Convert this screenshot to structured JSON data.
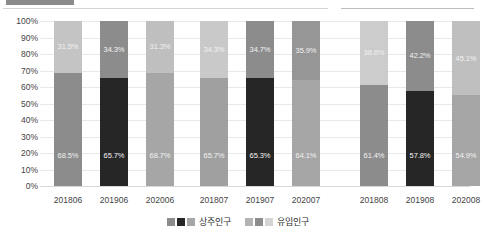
{
  "chart_data": {
    "type": "bar",
    "subtype": "stacked-100-percent",
    "title": "",
    "xlabel": "",
    "ylabel": "",
    "ylim": [
      0,
      100
    ],
    "ytick_labels": [
      "100%",
      "90%",
      "80%",
      "70%",
      "60%",
      "50%",
      "40%",
      "30%",
      "20%",
      "10%",
      "0%"
    ],
    "ytick_values": [
      100,
      90,
      80,
      70,
      60,
      50,
      40,
      30,
      20,
      10,
      0
    ],
    "grid": true,
    "legend_position": "bottom",
    "categories": [
      "201806",
      "201906",
      "202006",
      "201807",
      "201907",
      "202007",
      "201808",
      "201908",
      "202008"
    ],
    "groups": [
      {
        "name": "6월",
        "categories": [
          "201806",
          "201906",
          "202006"
        ],
        "bars": [
          {
            "category": "201806",
            "bottom_value": 68.5,
            "bottom_label": "68.5%",
            "top_value": 31.5,
            "top_label": "31.5%",
            "bottom_color": "#8c8c8c",
            "top_color": "#c4c4c4"
          },
          {
            "category": "201906",
            "bottom_value": 65.7,
            "bottom_label": "65.7%",
            "top_value": 34.3,
            "top_label": "34.3%",
            "bottom_color": "#262626",
            "top_color": "#8c8c8c"
          },
          {
            "category": "202006",
            "bottom_value": 68.7,
            "bottom_label": "68.7%",
            "top_value": 31.3,
            "top_label": "31.3%",
            "bottom_color": "#a6a6a6",
            "top_color": "#bfbfbf"
          }
        ]
      },
      {
        "name": "7월",
        "categories": [
          "201807",
          "201907",
          "202007"
        ],
        "bars": [
          {
            "category": "201807",
            "bottom_value": 65.7,
            "bottom_label": "65.7%",
            "top_value": 34.3,
            "top_label": "34.3%",
            "bottom_color": "#a0a0a0",
            "top_color": "#c9c9c9"
          },
          {
            "category": "201907",
            "bottom_value": 65.3,
            "bottom_label": "65.3%",
            "top_value": 34.7,
            "top_label": "34.7%",
            "bottom_color": "#262626",
            "top_color": "#8c8c8c"
          },
          {
            "category": "202007",
            "bottom_value": 64.1,
            "bottom_label": "64.1%",
            "top_value": 35.9,
            "top_label": "35.9%",
            "bottom_color": "#a6a6a6",
            "top_color": "#969696"
          }
        ]
      },
      {
        "name": "8월",
        "categories": [
          "201808",
          "201908",
          "202008"
        ],
        "bars": [
          {
            "category": "201808",
            "bottom_value": 61.4,
            "bottom_label": "61.4%",
            "top_value": 38.6,
            "top_label": "38.6%",
            "bottom_color": "#8c8c8c",
            "top_color": "#cccccc"
          },
          {
            "category": "201908",
            "bottom_value": 57.8,
            "bottom_label": "57.8%",
            "top_value": 42.2,
            "top_label": "42.2%",
            "bottom_color": "#262626",
            "top_color": "#8c8c8c"
          },
          {
            "category": "202008",
            "bottom_value": 54.9,
            "bottom_label": "54.9%",
            "top_value": 45.1,
            "top_label": "45.1%",
            "bottom_color": "#a6a6a6",
            "top_color": "#bfbfbf"
          }
        ]
      }
    ],
    "series": [
      {
        "name": "상주인구",
        "values": [
          68.5,
          65.7,
          68.7,
          65.7,
          65.3,
          64.1,
          61.4,
          57.8,
          54.9
        ]
      },
      {
        "name": "유입인구",
        "values": [
          31.5,
          34.3,
          31.3,
          34.3,
          34.7,
          35.9,
          38.6,
          42.2,
          45.1
        ]
      }
    ],
    "legend": [
      {
        "label": "상주인구",
        "swatches": [
          "#8c8c8c",
          "#262626",
          "#a6a6a6"
        ]
      },
      {
        "label": "유입인구",
        "swatches": [
          "#b3b3b3",
          "#8c8c8c",
          "#d4d4d4"
        ]
      }
    ],
    "colors": {
      "resident_light": "#8c8c8c",
      "resident_dark": "#262626",
      "resident_mid": "#a6a6a6",
      "inflow_light": "#c4c4c4",
      "inflow_mid": "#8c8c8c",
      "gridline": "#e9e9e9"
    }
  }
}
